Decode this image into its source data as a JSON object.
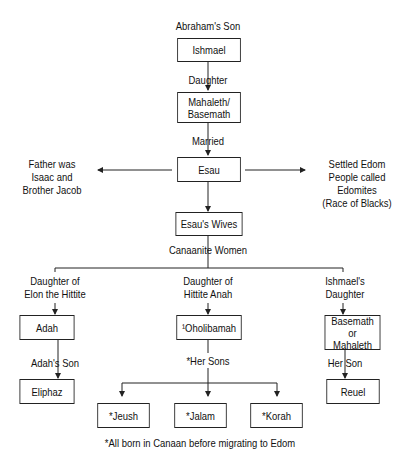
{
  "title_label": "Abraham's Son",
  "nodes": {
    "ishmael": "Ishmael",
    "mahaleth_basemath": "Mahaleth/ Basemath",
    "esau": "Esau",
    "esaus_wives": "Esau's Wives",
    "adah": "Adah",
    "oholibamah": "¹Oholibamah",
    "basemath_mahaleth": "Basemath or Mahaleth",
    "eliphaz": "Eliphaz",
    "jeush": "*Jeush",
    "jalam": "*Jalam",
    "korah": "*Korah",
    "reuel": "Reuel"
  },
  "edge_labels": {
    "daughter": "Daughter",
    "married": "Married",
    "canaanite_women": "Canaanite Women",
    "adah_origin": [
      "Daughter of",
      "Elon the Hittite"
    ],
    "oholibamah_origin": [
      "Daughter of",
      "Hittite Anah"
    ],
    "basemath_origin": [
      "Ishmael's",
      "Daughter"
    ],
    "adahs_son": "Adah's Son",
    "her_sons": "*Her Sons",
    "her_son": "Her Son"
  },
  "side_notes": {
    "left": [
      "Father was",
      "Isaac and",
      "Brother Jacob"
    ],
    "right": [
      "Settled Edom",
      "People called",
      "Edomites",
      "(Race of Blacks)"
    ]
  },
  "footnote": "*All born in Canaan before migrating to Edom",
  "colors": {
    "line": "#222222",
    "background": "#ffffff",
    "text": "#111111"
  }
}
